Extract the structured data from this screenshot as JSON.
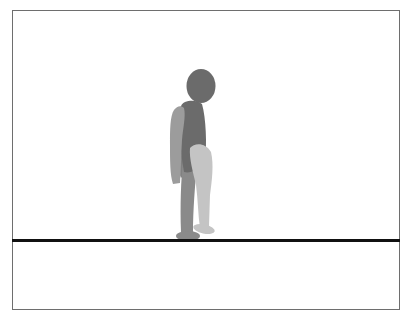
{
  "scene": {
    "type": "physics-simulation-viewport",
    "background": "#ffffff",
    "border_color": "#6e6e6e",
    "ground": {
      "color": "#111111",
      "y": 240,
      "thickness": 3
    },
    "character": {
      "name": "walker",
      "pose": "stepping",
      "colors": {
        "head": "#6b6b6b",
        "torso": "#6b6b6b",
        "near_arm": "#9c9c9c",
        "far_arm": "#808080",
        "far_leg": "#8a8a8a",
        "near_leg": "#c4c4c4",
        "far_foot": "#8a8a8a",
        "near_foot": "#c4c4c4"
      }
    }
  }
}
